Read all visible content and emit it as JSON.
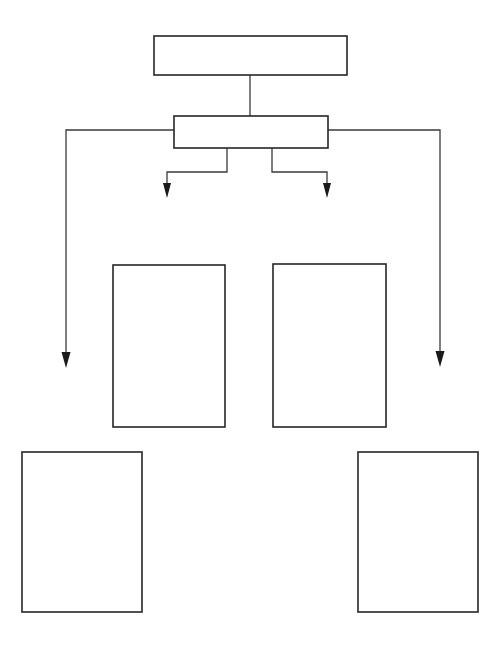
{
  "page": {
    "background_color": "#ffffff",
    "width": 499,
    "height": 655
  },
  "style": {
    "stroke_color": "#3a3a3a",
    "stroke_color_dark": "#262626",
    "fill_color": "#ffffff",
    "stroke_width_box": 1.6,
    "stroke_width_line": 1.3,
    "arrow_fill": "#1a1a1a"
  },
  "nodes": [
    {
      "id": "node-top",
      "name": "top-box",
      "label": "",
      "x": 154,
      "y": 36,
      "width": 193,
      "height": 39
    },
    {
      "id": "node-second",
      "name": "second-box",
      "label": "",
      "x": 174,
      "y": 116,
      "width": 154,
      "height": 32
    },
    {
      "id": "node-mid-left",
      "name": "middle-left-box",
      "label": "",
      "x": 113,
      "y": 265,
      "width": 112,
      "height": 162
    },
    {
      "id": "node-mid-right",
      "name": "middle-right-box",
      "label": "",
      "x": 273,
      "y": 264,
      "width": 113,
      "height": 163
    },
    {
      "id": "node-bottom-left",
      "name": "bottom-left-box",
      "label": "",
      "x": 22,
      "y": 452,
      "width": 120,
      "height": 160
    },
    {
      "id": "node-bottom-right",
      "name": "bottom-right-box",
      "label": "",
      "x": 358,
      "y": 452,
      "width": 120,
      "height": 160
    }
  ],
  "connectors": [
    {
      "id": "conn-top-to-second",
      "name": "connector-top-to-second",
      "path": "M 250 75 L 250 116",
      "arrow": "none"
    },
    {
      "id": "conn-second-inner-left",
      "name": "connector-second-to-left-arrow",
      "path": "M 227 148 L 227 172 L 167 172 L 167 184",
      "arrow": "down",
      "arrow_x": 167,
      "arrow_y": 198
    },
    {
      "id": "conn-second-inner-right",
      "name": "connector-second-to-right-arrow",
      "path": "M 272 148 L 272 172 L 327 172 L 327 184",
      "arrow": "down",
      "arrow_x": 327,
      "arrow_y": 198
    },
    {
      "id": "conn-second-outer-left",
      "name": "connector-second-to-bottom-left",
      "path": "M 174 130 L 66 130 L 66 353",
      "arrow": "down",
      "arrow_x": 66,
      "arrow_y": 368
    },
    {
      "id": "conn-second-outer-right",
      "name": "connector-second-to-bottom-right",
      "path": "M 328 130 L 440 130 L 440 352",
      "arrow": "down",
      "arrow_x": 440,
      "arrow_y": 367
    }
  ],
  "arrowheads": [
    {
      "id": "arrow-inner-left",
      "name": "arrowhead-inner-left",
      "x": 167,
      "y": 198,
      "width": 8,
      "height": 15
    },
    {
      "id": "arrow-inner-right",
      "name": "arrowhead-inner-right",
      "x": 327,
      "y": 198,
      "width": 8,
      "height": 15
    },
    {
      "id": "arrow-outer-left",
      "name": "arrowhead-outer-left",
      "x": 66,
      "y": 368,
      "width": 9,
      "height": 16
    },
    {
      "id": "arrow-outer-right",
      "name": "arrowhead-outer-right",
      "x": 440,
      "y": 367,
      "width": 9,
      "height": 16
    }
  ]
}
